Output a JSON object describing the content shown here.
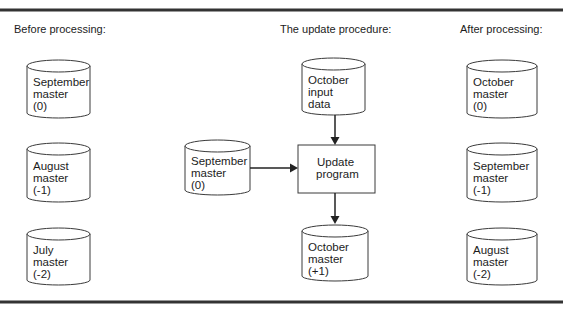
{
  "sections": {
    "before": "Before processing:",
    "procedure": "The update procedure:",
    "after": "After processing:"
  },
  "before_files": [
    {
      "lines": [
        "September",
        "master",
        "(0)"
      ]
    },
    {
      "lines": [
        "August",
        "master",
        "(-1)"
      ]
    },
    {
      "lines": [
        "July",
        "master",
        "(-2)"
      ]
    }
  ],
  "procedure": {
    "input_file": {
      "lines": [
        "October",
        "input",
        "data"
      ]
    },
    "old_master": {
      "lines": [
        "September",
        "master",
        "(0)"
      ]
    },
    "program": {
      "lines": [
        "Update",
        "program"
      ]
    },
    "new_master": {
      "lines": [
        "October",
        "master",
        "(+1)"
      ]
    }
  },
  "after_files": [
    {
      "lines": [
        "October",
        "master",
        "(0)"
      ]
    },
    {
      "lines": [
        "September",
        "master",
        "(-1)"
      ]
    },
    {
      "lines": [
        "August",
        "master",
        "(-2)"
      ]
    }
  ],
  "colors": {
    "stroke": "#3a3a3a",
    "text": "#1c1c1c",
    "background": "#ffffff"
  }
}
